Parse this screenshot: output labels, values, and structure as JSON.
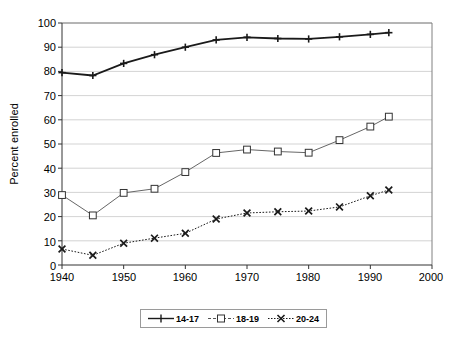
{
  "chart_data": {
    "type": "line",
    "title": "",
    "xlabel": "",
    "ylabel": "Percent enrolled",
    "xlim": [
      1940,
      2000
    ],
    "ylim": [
      0,
      100
    ],
    "xticks": [
      1940,
      1950,
      1960,
      1970,
      1980,
      1990,
      2000
    ],
    "yticks": [
      0,
      10,
      20,
      30,
      40,
      50,
      60,
      70,
      80,
      90,
      100
    ],
    "grid": true,
    "legend_position": "bottom-center",
    "series": [
      {
        "name": "14-17",
        "marker": "plus",
        "line_style": "solid",
        "x": [
          1940,
          1945,
          1950,
          1955,
          1960,
          1965,
          1970,
          1975,
          1980,
          1985,
          1990,
          1993
        ],
        "values": [
          79.5,
          78.3,
          83.3,
          86.9,
          90.0,
          93.0,
          94.1,
          93.6,
          93.4,
          94.3,
          95.3,
          96.0
        ]
      },
      {
        "name": "18-19",
        "marker": "square",
        "line_style": "solid",
        "x": [
          1940,
          1945,
          1950,
          1955,
          1960,
          1965,
          1970,
          1975,
          1980,
          1985,
          1990,
          1993
        ],
        "values": [
          28.9,
          20.5,
          29.8,
          31.5,
          38.4,
          46.3,
          47.7,
          46.9,
          46.4,
          51.6,
          57.2,
          61.3
        ]
      },
      {
        "name": "20-24",
        "marker": "x",
        "line_style": "dotted",
        "x": [
          1940,
          1945,
          1950,
          1955,
          1960,
          1965,
          1970,
          1975,
          1980,
          1985,
          1990,
          1993
        ],
        "values": [
          6.6,
          4.0,
          9.0,
          11.1,
          13.1,
          19.0,
          21.5,
          22.0,
          22.3,
          24.0,
          28.6,
          31.0
        ]
      }
    ]
  },
  "axes": {
    "y_title": "Percent enrolled",
    "y_tick_labels": [
      "100",
      "90",
      "80",
      "70",
      "60",
      "50",
      "40",
      "30",
      "20",
      "10",
      "0"
    ],
    "x_tick_labels": [
      "1940",
      "1950",
      "1960",
      "1970",
      "1980",
      "1990",
      "2000"
    ]
  },
  "legend": {
    "entries": [
      {
        "label": "14-17"
      },
      {
        "label": "18-19"
      },
      {
        "label": "20-24"
      }
    ]
  },
  "colors": {
    "series_14_17": "#1a1a1a",
    "series_18_19": "#555555",
    "series_20_24": "#1a1a1a",
    "grid": "#c8c8c8",
    "frame": "#808080",
    "background": "#ffffff"
  }
}
